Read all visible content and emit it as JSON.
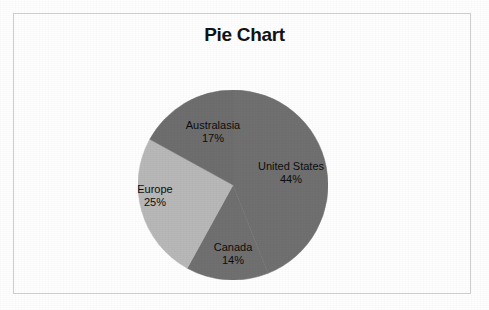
{
  "figure": {
    "title": "Pie Chart",
    "background_color": "#fefefe",
    "frame_color": "#cfcfcf"
  },
  "chart_data": {
    "type": "pie",
    "title": "Pie Chart",
    "xlabel": "",
    "ylabel": "",
    "legend_position": "none",
    "grid": false,
    "start_angle_deg": 0,
    "direction": "clockwise",
    "labels": [
      "United States",
      "Canada",
      "Europe",
      "Australasia"
    ],
    "values": [
      44,
      14,
      25,
      17
    ],
    "value_suffix": "%",
    "colors": [
      "#707070",
      "#707070",
      "#b8b8b8",
      "#6e6e6e"
    ],
    "slices": [
      {
        "name": "United States",
        "value": 44,
        "display_value": "44%",
        "color": "#707070",
        "label_name": "United States",
        "label_pct": "44%"
      },
      {
        "name": "Canada",
        "value": 14,
        "display_value": "14%",
        "color": "#707070",
        "label_name": "Canada",
        "label_pct": "14%"
      },
      {
        "name": "Europe",
        "value": 25,
        "display_value": "25%",
        "color": "#b8b8b8",
        "label_name": "Europe",
        "label_pct": "25%"
      },
      {
        "name": "Australasia",
        "value": 17,
        "display_value": "17%",
        "color": "#6e6e6e",
        "label_name": "Australasia",
        "label_pct": "17%"
      }
    ]
  }
}
